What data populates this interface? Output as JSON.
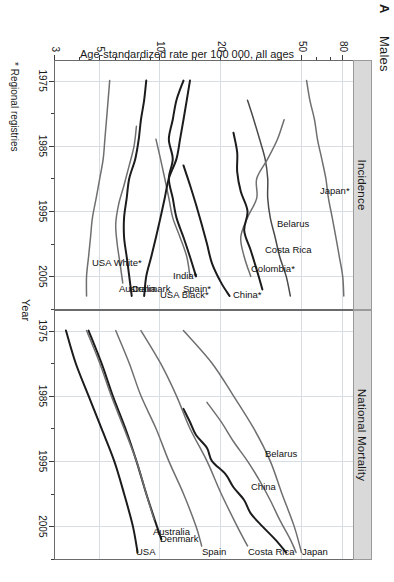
{
  "figure": {
    "panel_letter": "A",
    "title": "Males",
    "footnote": "* Regional registries",
    "x_axis": {
      "label": "Year",
      "ticks": [
        1975,
        1985,
        1995,
        2005
      ],
      "minor_ticks": [
        1980,
        1990,
        2000,
        2010
      ],
      "range": [
        1972,
        2010
      ]
    },
    "y_axis": {
      "label": "Age-standardized rate per 100 000, all ages",
      "scale": "log",
      "ticks": [
        3,
        5,
        10,
        20,
        50,
        80
      ],
      "minor_ticks": [
        4,
        6,
        7,
        8,
        9,
        15,
        25,
        30,
        40,
        60,
        70
      ],
      "range": [
        3,
        90
      ]
    },
    "colors": {
      "dark_line": "#1c1c1c",
      "grey_line": "#6f6f6f",
      "strip_fill": "#d9d9d9",
      "strip_border": "#9a9a9a",
      "grid": "#d8dde3",
      "axis": "#6b6b6b"
    }
  },
  "chart_data": {
    "type": "line",
    "title": "Males",
    "xlabel": "Year",
    "ylabel": "Age-standardized rate per 100 000, all ages",
    "yscale": "log",
    "ylim": [
      3,
      90
    ],
    "xlim": [
      1972,
      2010
    ],
    "grid": true,
    "legend": "inline-labels",
    "panels": [
      {
        "name": "Incidence",
        "series": [
          {
            "name": "Japan*",
            "color": "#6f6f6f",
            "label_at": [
              1991,
              62
            ],
            "x": [
              1975,
              1978,
              1981,
              1984,
              1987,
              1990,
              1993,
              1996,
              1999,
              2002,
              2005,
              2008
            ],
            "y": [
              53,
              55,
              58,
              60,
              63,
              66,
              68,
              71,
              74,
              77,
              80,
              81
            ]
          },
          {
            "name": "Belarus",
            "color": "#4a4a4a",
            "label_at": [
              1996,
              38
            ],
            "x": [
              1978,
              1981,
              1984,
              1987,
              1990,
              1993,
              1996,
              1999,
              2002,
              2005,
              2008
            ],
            "y": [
              27,
              29,
              31,
              33,
              34,
              34,
              35,
              37,
              39,
              42,
              44
            ]
          },
          {
            "name": "Costa Rica",
            "color": "#6f6f6f",
            "label_at": [
              2000,
              33
            ],
            "x": [
              1981,
              1984,
              1987,
              1990,
              1993,
              1996,
              1999,
              2002,
              2005
            ],
            "y": [
              41,
              38,
              34,
              30,
              30,
              27,
              25,
              26,
              28
            ]
          },
          {
            "name": "Colombia*",
            "color": "#1c1c1c",
            "label_at": [
              2003,
              28
            ],
            "x": [
              1983,
              1986,
              1989,
              1992,
              1995,
              1998,
              2001,
              2004,
              2007
            ],
            "y": [
              23,
              24,
              24,
              25,
              27,
              26,
              28,
              30,
              32
            ]
          },
          {
            "name": "China*",
            "color": "#1c1c1c",
            "label_at": [
              2007,
              23
            ],
            "x": [
              1988,
              1991,
              1994,
              1997,
              2000,
              2003,
              2006,
              2008
            ],
            "y": [
              13,
              14,
              15,
              16,
              17,
              18,
              20,
              22
            ]
          },
          {
            "name": "India*",
            "color": "#6f6f6f",
            "label_at": [
              2004,
              11.5
            ],
            "x": [
              1984,
              1987,
              1990,
              1993,
              1996,
              1999,
              2002,
              2005
            ],
            "y": [
              9.5,
              10,
              10.5,
              11,
              11.5,
              12.5,
              13.5,
              14
            ]
          },
          {
            "name": "Spain*",
            "color": "#1c1c1c",
            "label_at": [
              2006,
              13
            ],
            "x": [
              1975,
              1978,
              1981,
              1984,
              1987,
              1990,
              1993,
              1996,
              1999,
              2002,
              2005
            ],
            "y": [
              13,
              12,
              11.5,
              11,
              11.5,
              11,
              11.5,
              12,
              13,
              14,
              15
            ]
          },
          {
            "name": "USA Black*",
            "color": "#1c1c1c",
            "label_at": [
              2007,
              10
            ],
            "x": [
              1975,
              1978,
              1981,
              1984,
              1987,
              1990,
              1993,
              1996,
              1999,
              2002,
              2005,
              2008
            ],
            "y": [
              14,
              13.5,
              13,
              12.5,
              12,
              11,
              10.5,
              10,
              9.5,
              9,
              8.5,
              8.3
            ]
          },
          {
            "name": "Denmark",
            "color": "#1c1c1c",
            "label_at": [
              2006,
              7.2
            ],
            "x": [
              1975,
              1978,
              1981,
              1984,
              1987,
              1990,
              1993,
              1996,
              1999,
              2002,
              2005,
              2008
            ],
            "y": [
              8.5,
              8.3,
              8.0,
              7.8,
              7.5,
              7.0,
              6.8,
              6.6,
              6.6,
              6.8,
              7.0,
              7.2
            ]
          },
          {
            "name": "Australia",
            "color": "#6f6f6f",
            "label_at": [
              2006,
              6.2
            ],
            "x": [
              1982,
              1985,
              1988,
              1991,
              1994,
              1997,
              2000,
              2003,
              2006
            ],
            "y": [
              7.6,
              7.4,
              7.0,
              6.6,
              6.2,
              6.0,
              6.1,
              6.3,
              6.5
            ]
          },
          {
            "name": "USA White*",
            "color": "#6f6f6f",
            "label_at": [
              2002,
              4.6
            ],
            "x": [
              1975,
              1978,
              1981,
              1984,
              1987,
              1990,
              1993,
              1996,
              1999,
              2002,
              2005,
              2008
            ],
            "y": [
              5.6,
              5.5,
              5.4,
              5.3,
              5.2,
              5.0,
              4.8,
              4.6,
              4.5,
              4.4,
              4.3,
              4.3
            ]
          }
        ]
      },
      {
        "name": "National Mortality",
        "series": [
          {
            "name": "Japan",
            "color": "#6f6f6f",
            "label_at": [
              2008,
              50
            ],
            "x": [
              1975,
              1980,
              1985,
              1990,
              1995,
              2000,
              2005,
              2009
            ],
            "y": [
              13,
              18,
              23,
              29,
              35,
              40,
              46,
              50
            ]
          },
          {
            "name": "China",
            "color": "#1c1c1c",
            "label_at": [
              1998,
              28
            ],
            "x": [
              1987,
              1989,
              1991,
              1993,
              1995,
              1997,
              1999,
              2001,
              2003,
              2005,
              2007,
              2009
            ],
            "y": [
              13,
              14,
              15,
              17,
              18,
              21,
              23,
              26,
              28,
              32,
              37,
              42
            ]
          },
          {
            "name": "Belarus",
            "color": "#6f6f6f",
            "label_at": [
              1993,
              33
            ],
            "x": [
              1986,
              1989,
              1992,
              1995,
              1998,
              2001,
              2004,
              2007,
              2009
            ],
            "y": [
              17,
              20,
              23,
              27,
              31,
              35,
              39,
              44,
              47
            ]
          },
          {
            "name": "Costa Rica",
            "color": "#6f6f6f",
            "label_at": [
              2008,
              27
            ],
            "x": [
              1975,
              1980,
              1985,
              1990,
              1995,
              2000,
              2005,
              2008
            ],
            "y": [
              8,
              10,
              12,
              14,
              17,
              20,
              24,
              27
            ]
          },
          {
            "name": "Spain",
            "color": "#6f6f6f",
            "label_at": [
              2008,
              16
            ],
            "x": [
              1975,
              1980,
              1985,
              1990,
              1995,
              2000,
              2005,
              2008
            ],
            "y": [
              6.0,
              7.0,
              8.0,
              9.5,
              11,
              13,
              15,
              16
            ]
          },
          {
            "name": "Denmark",
            "color": "#1c1c1c",
            "label_at": [
              2006,
              10
            ],
            "x": [
              1975,
              1980,
              1985,
              1990,
              1995,
              2000,
              2005,
              2007
            ],
            "y": [
              4.4,
              5.1,
              5.8,
              6.7,
              7.6,
              8.5,
              9.6,
              10.1
            ]
          },
          {
            "name": "Australia",
            "color": "#6f6f6f",
            "label_at": [
              2005,
              9.2
            ],
            "x": [
              1975,
              1980,
              1985,
              1990,
              1995,
              2000,
              2004
            ],
            "y": [
              4.3,
              5.0,
              5.7,
              6.6,
              7.6,
              8.5,
              9.3
            ]
          },
          {
            "name": "USA",
            "color": "#1c1c1c",
            "label_at": [
              2008,
              7.6
            ],
            "x": [
              1975,
              1980,
              1985,
              1990,
              1995,
              2000,
              2005,
              2009
            ],
            "y": [
              3.4,
              3.8,
              4.4,
              5.1,
              5.9,
              6.6,
              7.3,
              7.7
            ]
          }
        ]
      }
    ]
  }
}
